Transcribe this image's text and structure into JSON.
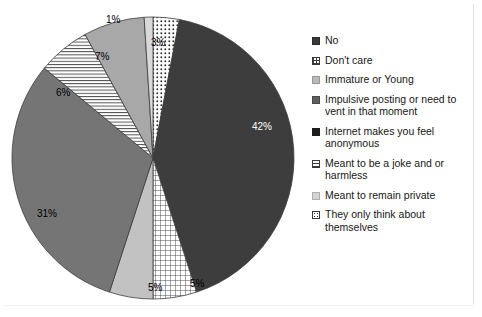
{
  "chart_data": {
    "type": "pie",
    "title": "",
    "subtitle": "",
    "xlabel": "",
    "ylabel": "",
    "legend_position": "right",
    "grid": false,
    "start_angle_deg": 0,
    "direction": "clockwise",
    "categories": [
      "They only think about themselves",
      "No",
      "Don't care",
      "Immature or Young",
      "Impulsive posting or need to vent in that moment",
      "Meant to be a joke and or harmless",
      "Internet makes you feel anonymous",
      "Meant to remain private"
    ],
    "values": [
      3,
      42,
      5,
      5,
      31,
      6,
      7,
      1
    ],
    "value_labels": [
      "3%",
      "42%",
      "5%",
      "5%",
      "31%",
      "6%",
      "7%",
      "1%"
    ],
    "slices": [
      {
        "label": "They only think about themselves",
        "value": 3,
        "value_label": "3%",
        "pattern": "dots",
        "fill": "#ffffff",
        "pattern_color": "#2e2e2e",
        "label_color": "#000000",
        "label_x": 151,
        "label_y": 38
      },
      {
        "label": "No",
        "value": 42,
        "value_label": "42%",
        "pattern": "solid",
        "fill": "#3d3d3d",
        "pattern_color": "",
        "label_color": "#ffffff",
        "label_x": 252,
        "label_y": 122
      },
      {
        "label": "Don't care",
        "value": 5,
        "value_label": "5%",
        "pattern": "grid",
        "fill": "#ffffff",
        "pattern_color": "#3b3b3b",
        "label_color": "#000000",
        "label_x": 190,
        "label_y": 279
      },
      {
        "label": "Immature or Young",
        "value": 5,
        "value_label": "5%",
        "pattern": "solid",
        "fill": "#c2c2c2",
        "pattern_color": "",
        "label_color": "#000000",
        "label_x": 148,
        "label_y": 283
      },
      {
        "label": "Impulsive posting or need to vent in that moment",
        "value": 31,
        "value_label": "31%",
        "pattern": "solid",
        "fill": "#757575",
        "pattern_color": "",
        "label_color": "#000000",
        "label_x": 37,
        "label_y": 209
      },
      {
        "label": "Meant to be a joke and or harmless",
        "value": 6,
        "value_label": "6%",
        "pattern": "hlines",
        "fill": "#ffffff",
        "pattern_color": "#3b3b3b",
        "label_color": "#000000",
        "label_x": 56,
        "label_y": 88
      },
      {
        "label": "Internet makes you feel anonymous",
        "value": 7,
        "value_label": "7%",
        "pattern": "solid",
        "fill": "#a8a8a8",
        "pattern_color": "",
        "label_color": "#000000",
        "label_x": 95,
        "label_y": 52
      },
      {
        "label": "Meant to remain private",
        "value": 1,
        "value_label": "1%",
        "pattern": "solid",
        "fill": "#d9d9d9",
        "pattern_color": "",
        "label_color": "#000000",
        "label_x": 106,
        "label_y": 15
      }
    ]
  },
  "legend": {
    "items": [
      {
        "label": "No",
        "swatch": "solid-dark",
        "swatch_name": "legend-swatch-no"
      },
      {
        "label": "Don't care",
        "swatch": "grid",
        "swatch_name": "legend-swatch-dont-care"
      },
      {
        "label": "Immature or Young",
        "swatch": "solid-light",
        "swatch_name": "legend-swatch-immature-or-young"
      },
      {
        "label": "Impulsive posting or need to vent in that moment",
        "swatch": "solid-mid",
        "swatch_name": "legend-swatch-impulsive-posting"
      },
      {
        "label": "Internet makes you feel anonymous",
        "swatch": "solid-black",
        "swatch_name": "legend-swatch-internet-anonymous"
      },
      {
        "label": "Meant to be a joke and or harmless",
        "swatch": "hlines",
        "swatch_name": "legend-swatch-joke-or-harmless"
      },
      {
        "label": "Meant to remain private",
        "swatch": "solid-vlight",
        "swatch_name": "legend-swatch-remain-private"
      },
      {
        "label": "They only think about themselves",
        "swatch": "dots",
        "swatch_name": "legend-swatch-think-about-themselves"
      }
    ]
  },
  "geometry": {
    "center_x": 153,
    "center_y": 158,
    "radius": 141
  }
}
